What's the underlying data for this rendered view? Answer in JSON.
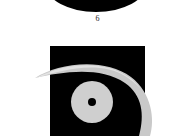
{
  "page": {
    "background_color": "#ffffff",
    "width": 195,
    "height": 136
  },
  "figure_above": {
    "caption": "6",
    "shape_name": "clipped-black-lens-shape",
    "color": "#000000",
    "description_visible": false
  },
  "figure_main": {
    "caption": "",
    "panel": {
      "color": "#000000",
      "x": 50,
      "y": 46,
      "width": 95,
      "height": 90
    },
    "eye_logo": {
      "eyelid_color": "#c9c9c9",
      "eyelid_highlight_color": "#e2e2e2",
      "iris_ring_color": "#000000",
      "pupil_disc_color": "#cfcfcf",
      "pupil_dot_color": "#000000",
      "pupil_center_x": 92,
      "pupil_center_y": 102,
      "pupil_dot_radius": 4
    }
  }
}
